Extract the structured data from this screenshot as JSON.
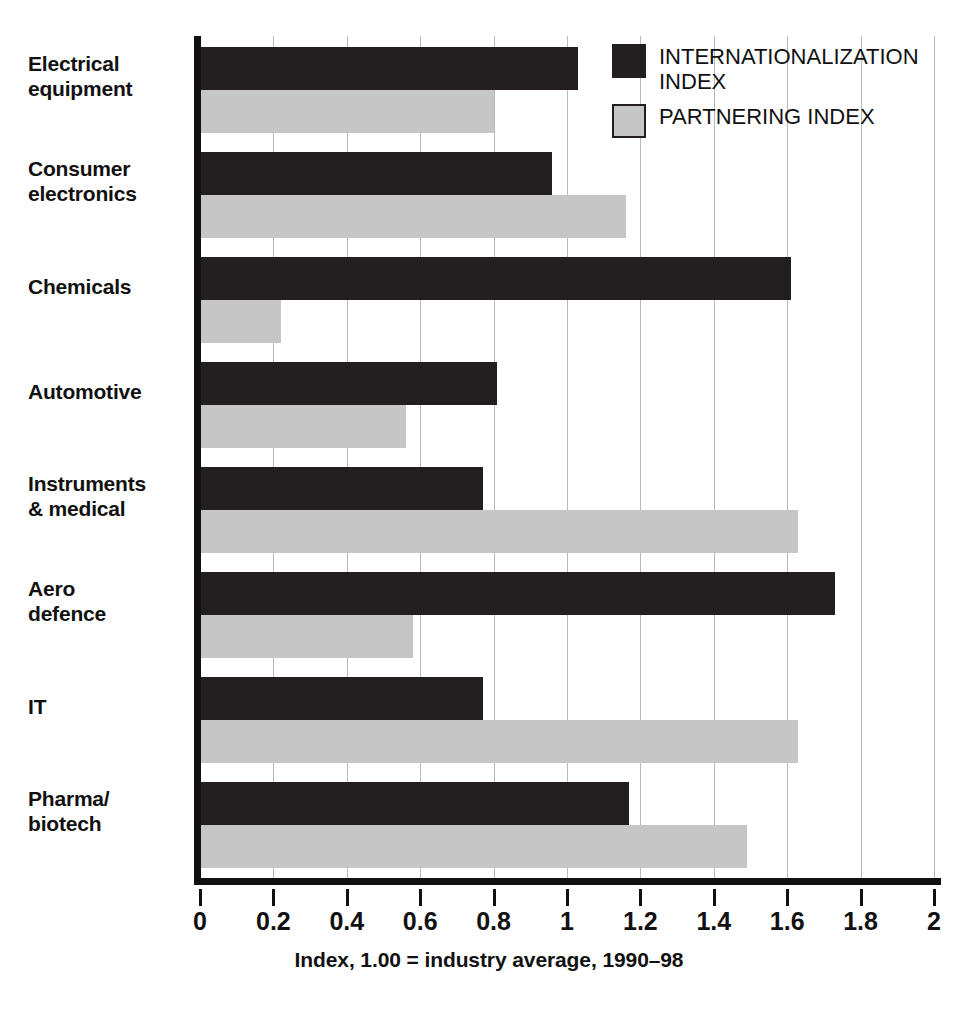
{
  "chart_data": {
    "type": "bar",
    "orientation": "horizontal",
    "title": "",
    "xlabel": "Index, 1.00 = industry average, 1990–98",
    "ylabel": "",
    "xlim": [
      0,
      2
    ],
    "xticks": [
      "0",
      "0.2",
      "0.4",
      "0.6",
      "0.8",
      "1",
      "1.2",
      "1.4",
      "1.6",
      "1.8",
      "2"
    ],
    "xtick_values": [
      0,
      0.2,
      0.4,
      0.6,
      0.8,
      1,
      1.2,
      1.4,
      1.6,
      1.8,
      2
    ],
    "grid": "vertical",
    "legend_position": "top-right",
    "categories": [
      "Electrical equipment",
      "Consumer electronics",
      "Chemicals",
      "Automotive",
      "Instruments & medical",
      "Aero defence",
      "IT",
      "Pharma/biotech"
    ],
    "category_lines": [
      [
        "Electrical",
        "equipment"
      ],
      [
        "Consumer",
        "electronics"
      ],
      [
        "Chemicals"
      ],
      [
        "Automotive"
      ],
      [
        "Instruments",
        "& medical"
      ],
      [
        "Aero",
        "defence"
      ],
      [
        "IT"
      ],
      [
        "Pharma/",
        "biotech"
      ]
    ],
    "series": [
      {
        "name": "INTERNATIONALIZATION INDEX",
        "color": "#231f20",
        "values": [
          1.03,
          0.96,
          1.61,
          0.81,
          0.77,
          1.73,
          0.77,
          1.17
        ]
      },
      {
        "name": "PARTNERING INDEX",
        "color": "#c6c6c6",
        "values": [
          0.8,
          1.16,
          0.22,
          0.56,
          1.63,
          0.58,
          1.63,
          1.49
        ]
      }
    ]
  },
  "legend": {
    "items": [
      {
        "label": "INTERNATIONALIZATION INDEX",
        "swatch": "dark"
      },
      {
        "label": "PARTNERING INDEX",
        "swatch": "light"
      }
    ]
  },
  "axis": {
    "x_title": "Index, 1.00 = industry average, 1990–98"
  },
  "colors": {
    "dark_series": "#231f20",
    "light_series": "#c6c6c6",
    "gridline": "#b9b9b9",
    "axis": "#111111",
    "background": "#ffffff"
  }
}
